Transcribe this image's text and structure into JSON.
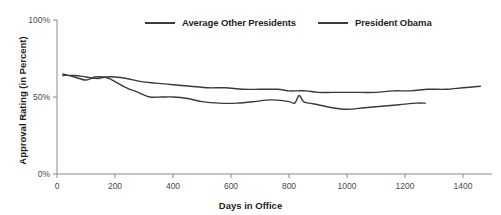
{
  "chart_data": {
    "type": "line",
    "title": "",
    "subtitle": "",
    "xlabel": "Days in Office",
    "ylabel": "Approval Rating (in Percent)",
    "xlim": [
      0,
      1500
    ],
    "ylim": [
      0,
      100
    ],
    "xticks": [
      0,
      200,
      400,
      600,
      800,
      1000,
      1200,
      1400
    ],
    "xtick_labels": [
      "0",
      "200",
      "400",
      "600",
      "800",
      "1000",
      "1200",
      "1400"
    ],
    "yticks": [
      0,
      50,
      100
    ],
    "ytick_labels": [
      "0%",
      "50%",
      "100%"
    ],
    "grid": false,
    "legend_position": "top-center",
    "line_color": "#3a3a3a",
    "background_color": "#ffffff",
    "axis_color": "#8a8a8a",
    "series": [
      {
        "name": "Average Other Presidents",
        "color": "#3a3a3a",
        "x": [
          20,
          60,
          100,
          140,
          170,
          200,
          240,
          290,
          340,
          400,
          460,
          520,
          580,
          640,
          700,
          760,
          800,
          830,
          860,
          900,
          950,
          1000,
          1050,
          1100,
          1160,
          1220,
          1280,
          1340,
          1400,
          1460
        ],
        "y": [
          64,
          64,
          63,
          62,
          63,
          63,
          62,
          60,
          59,
          58,
          57,
          56,
          56,
          55,
          55,
          55,
          54,
          54,
          54,
          53,
          53,
          53,
          53,
          53,
          54,
          54,
          55,
          55,
          56,
          57
        ]
      },
      {
        "name": "President Obama",
        "color": "#3a3a3a",
        "x": [
          20,
          60,
          100,
          130,
          160,
          180,
          200,
          240,
          280,
          320,
          360,
          400,
          450,
          500,
          560,
          620,
          680,
          720,
          760,
          800,
          820,
          835,
          850,
          870,
          900,
          950,
          1000,
          1060,
          1120,
          1180,
          1240,
          1270
        ],
        "y": [
          65,
          63,
          61,
          63,
          63,
          62,
          60,
          56,
          53,
          50,
          50,
          50,
          49,
          47,
          46,
          46,
          47,
          48,
          48,
          47,
          46,
          51,
          47,
          46,
          45,
          43,
          42,
          43,
          44,
          45,
          46,
          46
        ]
      }
    ]
  },
  "legend": {
    "entries": [
      {
        "label": "Average Other Presidents"
      },
      {
        "label": "President Obama"
      }
    ]
  }
}
